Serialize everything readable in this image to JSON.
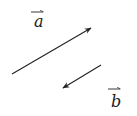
{
  "diagram": {
    "vectors": [
      {
        "name": "a",
        "label": "a",
        "from": [
          12,
          74
        ],
        "to": [
          91,
          28
        ],
        "label_pos": [
          34,
          27
        ],
        "label_bar": [
          [
            31,
            12
          ],
          [
            43,
            12
          ]
        ]
      },
      {
        "name": "b",
        "label": "b",
        "from": [
          101,
          65
        ],
        "to": [
          63,
          88
        ],
        "label_pos": [
          111,
          107
        ],
        "label_bar": [
          [
            108,
            89
          ],
          [
            120,
            89
          ]
        ]
      }
    ],
    "stroke_color": "#222222"
  }
}
